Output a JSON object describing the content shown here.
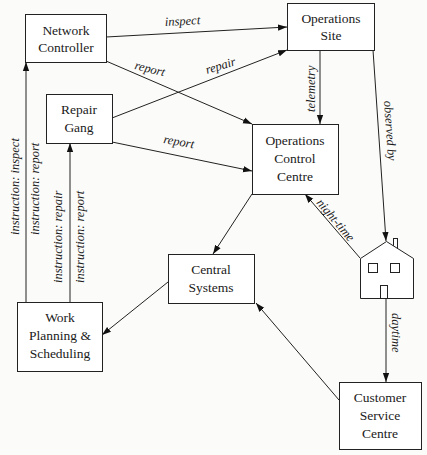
{
  "diagram": {
    "type": "information-flow",
    "nodes": {
      "network_controller": {
        "line1": "Network",
        "line2": "Controller"
      },
      "operations_site": {
        "line1": "Operations",
        "line2": "Site"
      },
      "repair_gang": {
        "line1": "Repair",
        "line2": "Gang"
      },
      "operations_control_centre": {
        "line1": "Operations",
        "line2": "Control",
        "line3": "Centre"
      },
      "central_systems": {
        "line1": "Central",
        "line2": "Systems"
      },
      "work_planning": {
        "line1": "Work",
        "line2": "Planning &",
        "line3": "Scheduling"
      },
      "customer_service_centre": {
        "line1": "Customer",
        "line2": "Service",
        "line3": "Centre"
      },
      "house": {
        "icon": "house-icon"
      }
    },
    "edges": {
      "nc_to_os": {
        "from": "Network Controller",
        "to": "Operations Site",
        "label": "inspect"
      },
      "nc_to_occ": {
        "from": "Network Controller",
        "to": "Operations Control Centre",
        "label": "report"
      },
      "rg_to_os": {
        "from": "Repair Gang",
        "to": "Operations Site",
        "label": "repair"
      },
      "rg_to_occ": {
        "from": "Repair Gang",
        "to": "Operations Control Centre",
        "label": "report"
      },
      "os_to_occ": {
        "from": "Operations Site",
        "to": "Operations Control Centre",
        "label": "telemetry"
      },
      "os_to_house": {
        "from": "Operations Site",
        "to": "House",
        "label": "observed by"
      },
      "house_to_occ": {
        "from": "House",
        "to": "Operations Control Centre",
        "label": "night-time"
      },
      "house_to_csc": {
        "from": "House",
        "to": "Customer Service Centre",
        "label": "daytime"
      },
      "occ_to_cs": {
        "from": "Operations Control Centre",
        "to": "Central Systems",
        "label": ""
      },
      "csc_to_cs": {
        "from": "Customer Service Centre",
        "to": "Central Systems",
        "label": ""
      },
      "cs_to_wp": {
        "from": "Central Systems",
        "to": "Work Planning & Scheduling",
        "label": ""
      },
      "wp_to_nc": {
        "from": "Work Planning & Scheduling",
        "to": "Network Controller",
        "label1": "instruction: inspect",
        "label2": "instruction: report"
      },
      "wp_to_rg": {
        "from": "Work Planning & Scheduling",
        "to": "Repair Gang",
        "label1": "instruction: repair",
        "label2": "instruction: report"
      }
    }
  }
}
